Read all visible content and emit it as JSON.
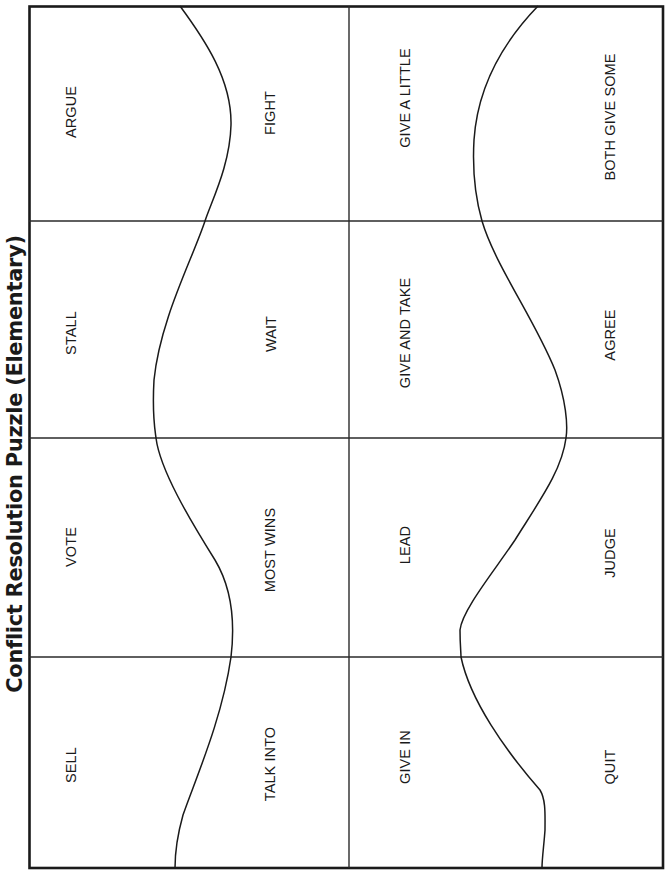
{
  "title": "Conflict Resolution Puzzle (Elementary)",
  "grid": {
    "columns": 2,
    "rows": 4,
    "border_color": "#1a1a1a",
    "line_color": "#2a2a2a"
  },
  "pieces": [
    {
      "id": "argue",
      "label": "ARGUE",
      "x": 71,
      "y": 112
    },
    {
      "id": "fight",
      "label": "FIGHT",
      "x": 270,
      "y": 113
    },
    {
      "id": "give-a-little",
      "label": "GIVE A LITTLE",
      "x": 405,
      "y": 98
    },
    {
      "id": "both-give-some",
      "label": "BOTH GIVE SOME",
      "x": 610,
      "y": 117
    },
    {
      "id": "stall",
      "label": "STALL",
      "x": 71,
      "y": 333
    },
    {
      "id": "wait",
      "label": "WAIT",
      "x": 271,
      "y": 334
    },
    {
      "id": "give-and-take",
      "label": "GIVE AND TAKE",
      "x": 405,
      "y": 333
    },
    {
      "id": "agree",
      "label": "AGREE",
      "x": 610,
      "y": 335
    },
    {
      "id": "vote",
      "label": "VOTE",
      "x": 71,
      "y": 547
    },
    {
      "id": "most-wins",
      "label": "MOST WINS",
      "x": 270,
      "y": 550
    },
    {
      "id": "lead",
      "label": "LEAD",
      "x": 405,
      "y": 545
    },
    {
      "id": "judge",
      "label": "JUDGE",
      "x": 610,
      "y": 553
    },
    {
      "id": "sell",
      "label": "SELL",
      "x": 71,
      "y": 765
    },
    {
      "id": "talk-into",
      "label": "TALK INTO",
      "x": 270,
      "y": 764
    },
    {
      "id": "give-in",
      "label": "GIVE IN",
      "x": 405,
      "y": 757
    },
    {
      "id": "quit",
      "label": "QUIT",
      "x": 610,
      "y": 767
    }
  ]
}
